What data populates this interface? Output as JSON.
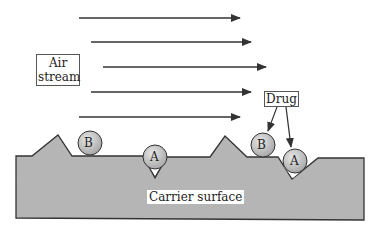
{
  "labels": {
    "air_stream": "Air\nstream",
    "air_line1": "Air",
    "air_line2": "stream",
    "drug": "Drug",
    "carrier": "Carrier surface"
  },
  "particles": [
    {
      "id": "B",
      "label": "B",
      "cx": 90,
      "cy": 143
    },
    {
      "id": "A",
      "label": "A",
      "cx": 155,
      "cy": 157
    },
    {
      "id": "B2",
      "label": "B",
      "cx": 263,
      "cy": 145
    },
    {
      "id": "A2",
      "label": "A",
      "cx": 295,
      "cy": 161
    }
  ],
  "colors": {
    "surface_fill": "#b5b5b5",
    "particle_fill": "#c8c8c8",
    "line": "#333333"
  }
}
